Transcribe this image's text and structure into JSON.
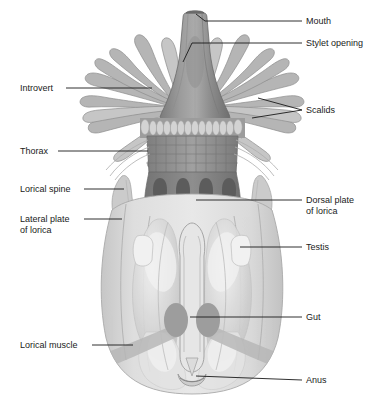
{
  "figure": {
    "background": "#ffffff",
    "palette": {
      "ink": "#1a1a1a",
      "mouth_cone_dark": "#6e6e6e",
      "mouth_cone_mid": "#8a8a8a",
      "mouth_cone_light": "#a6a6a6",
      "scalid_fill": "#a9a9a9",
      "scalid_light": "#c2c2c2",
      "scalid_band": "#cfcfcf",
      "thorax_fill": "#8f8f8f",
      "thorax_line": "#6f6f6f",
      "dorsal_plate": "#7d7d7d",
      "dorsal_notch": "#5f5f5f",
      "lorica_fill": "#dcdcdc",
      "lorica_edge": "#b4b4b4",
      "organ_lobe": "#cbcbcb",
      "organ_light": "#ececec",
      "testis_fill": "#ededed",
      "gut_dark": "#9a9a9a",
      "muscle_fill": "#b9b9b9",
      "spine_fill": "#c8c8c8"
    }
  },
  "labels": [
    {
      "id": "mouth",
      "text": "Mouth",
      "text2": "",
      "x": 306,
      "y": 24,
      "side": "right"
    },
    {
      "id": "stylet-opening",
      "text": "Stylet opening",
      "text2": "",
      "x": 306,
      "y": 46,
      "side": "right"
    },
    {
      "id": "scalids",
      "text": "Scalids",
      "text2": "",
      "x": 306,
      "y": 113,
      "side": "right"
    },
    {
      "id": "dorsal-plate",
      "text": "Dorsal plate",
      "text2": "of lorica",
      "x": 306,
      "y": 203,
      "side": "right"
    },
    {
      "id": "testis",
      "text": "Testis",
      "text2": "",
      "x": 306,
      "y": 250,
      "side": "right"
    },
    {
      "id": "gut",
      "text": "Gut",
      "text2": "",
      "x": 306,
      "y": 320,
      "side": "right"
    },
    {
      "id": "anus",
      "text": "Anus",
      "text2": "",
      "x": 306,
      "y": 383,
      "side": "right"
    },
    {
      "id": "introvert",
      "text": "Introvert",
      "text2": "",
      "x": 20,
      "y": 91,
      "side": "left"
    },
    {
      "id": "thorax",
      "text": "Thorax",
      "text2": "",
      "x": 20,
      "y": 154,
      "side": "left"
    },
    {
      "id": "lorical-spine",
      "text": "Lorical spine",
      "text2": "",
      "x": 20,
      "y": 192,
      "side": "left"
    },
    {
      "id": "lateral-plate",
      "text": "Lateral plate",
      "text2": "of lorica",
      "x": 20,
      "y": 222,
      "side": "left"
    },
    {
      "id": "lorical-muscle",
      "text": "Lorical muscle",
      "text2": "",
      "x": 20,
      "y": 348,
      "side": "left"
    }
  ],
  "leaders": [
    {
      "id": "mouth",
      "path": "M302,21 L205,21 L196,14"
    },
    {
      "id": "stylet-opening",
      "path": "M302,43 L192,43 L183,62"
    },
    {
      "id": "scalids",
      "path": "M302,110 L258,98"
    },
    {
      "id": "scalids-b",
      "path": "M302,110 L252,118"
    },
    {
      "id": "dorsal-plate",
      "path": "M302,200 L196,200"
    },
    {
      "id": "testis",
      "path": "M302,247 L240,247"
    },
    {
      "id": "gut",
      "path": "M302,317 L190,317"
    },
    {
      "id": "anus",
      "path": "M302,380 L196,375"
    },
    {
      "id": "introvert",
      "path": "M66,88 L152,88"
    },
    {
      "id": "thorax",
      "path": "M58,151 L148,151"
    },
    {
      "id": "lorical-spine",
      "path": "M84,189 L124,189"
    },
    {
      "id": "lateral-plate",
      "path": "M84,219 L122,219"
    },
    {
      "id": "lorical-muscle",
      "path": "M92,345 L133,345"
    }
  ],
  "anatomy": {
    "mouth_cone": {
      "name": "mouth-cone",
      "apex_y": 12,
      "base_y": 120
    },
    "stylet": {
      "name": "stylet-opening-marker"
    },
    "scalid_rows": [
      {
        "name": "outer-scalids",
        "count": 18
      },
      {
        "name": "inner-scalids",
        "count": 14
      }
    ],
    "scalid_band": {
      "name": "scalid-oval-band",
      "count": 15,
      "y": 126
    },
    "thorax": {
      "name": "thorax-segment",
      "rows": 4,
      "cols": 9,
      "top": 138,
      "bottom": 172
    },
    "dorsal_plate": {
      "name": "dorsal-plate-of-lorica",
      "notches": 4
    },
    "lorical_spines": {
      "name": "lorical-spine",
      "count": 2
    },
    "lorica": {
      "name": "lorica-body",
      "top": 196,
      "bottom": 392
    },
    "organ_lobes": {
      "name": "internal-organ-lobe",
      "count": 4
    },
    "testes": {
      "name": "testis",
      "count": 2
    },
    "gut": {
      "name": "gut-tube",
      "sacs": 2
    },
    "lorical_muscles": {
      "name": "lorical-muscle-band",
      "count": 2
    },
    "anus": {
      "name": "anus-opening",
      "y": 377
    }
  }
}
